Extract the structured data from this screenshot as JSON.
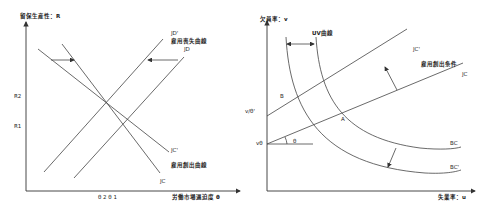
{
  "left_diagram": {
    "y_axis_label": "留保生産性：R",
    "x_axis_label": "労働市場逼迫度 θ",
    "y_ticks": [
      "R2",
      "R1"
    ],
    "x_ticks": [
      "θ2",
      "θ1"
    ],
    "x_tick_text": "θ 2 θ 1",
    "curves": {
      "jd_prime": "JD'",
      "jd_prime_caption": "雇用喪失曲線",
      "jd": "JD",
      "jc_prime": "JC'",
      "jc_caption": "雇用創出曲線",
      "jc": "JC"
    }
  },
  "right_diagram": {
    "y_axis_label": "欠員率：v",
    "x_axis_label": "失業率：u",
    "y_ticks": [
      "v/θ'",
      "vθ"
    ],
    "point_labels": {
      "b": "B",
      "a": "A",
      "angle": "θ"
    },
    "curves": {
      "uv_caption": "UV曲線",
      "jc_prime": "JC'",
      "jc_caption": "雇用創出条件",
      "jc": "JC",
      "bc": "BC",
      "bc_prime": "BC'"
    }
  }
}
